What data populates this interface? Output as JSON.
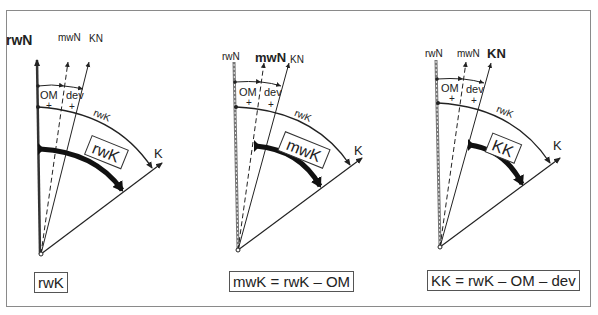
{
  "diagram": {
    "panels": [
      {
        "id": "true-course",
        "north_labels": {
          "rwN": "rwN",
          "mwN": "mwN",
          "KN": "KN"
        },
        "emphasized_north": "rwN",
        "sector_labels": {
          "om": "OM",
          "dev": "dev",
          "om_sign": "+",
          "dev_sign": "+"
        },
        "arc_label": "rwK",
        "course_label": "K",
        "highlighted_angle": "rwK",
        "formula": "rwK"
      },
      {
        "id": "magnetic-course",
        "north_labels": {
          "rwN": "rwN",
          "mwN": "mwN",
          "KN": "KN"
        },
        "emphasized_north": "mwN",
        "sector_labels": {
          "om": "OM",
          "dev": "dev",
          "om_sign": "+",
          "dev_sign": "+"
        },
        "arc_label": "rwK",
        "course_label": "K",
        "highlighted_angle": "mwK",
        "formula": "mwK = rwK – OM"
      },
      {
        "id": "compass-course",
        "north_labels": {
          "rwN": "rwN",
          "mwN": "mwN",
          "KN": "KN"
        },
        "emphasized_north": "KN",
        "sector_labels": {
          "om": "OM",
          "dev": "dev",
          "om_sign": "+",
          "dev_sign": "+"
        },
        "arc_label": "rwK",
        "course_label": "K",
        "highlighted_angle": "KK",
        "formula": "KK = rwK – OM – dev"
      }
    ]
  }
}
